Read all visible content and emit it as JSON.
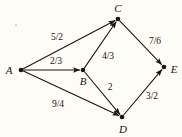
{
  "figure": {
    "background_color": "#fdfcf6",
    "ink_color": "#17140f",
    "width": 182,
    "height": 137
  },
  "diagram": {
    "type": "directed-weighted-graph",
    "nodes": [
      {
        "id": "A",
        "label": "A",
        "x": 21,
        "y": 70,
        "label_x": 9,
        "label_y": 70
      },
      {
        "id": "B",
        "label": "B",
        "x": 83,
        "y": 70,
        "label_x": 83,
        "label_y": 81
      },
      {
        "id": "C",
        "label": "C",
        "x": 118,
        "y": 19,
        "label_x": 118,
        "label_y": 8
      },
      {
        "id": "D",
        "label": "D",
        "x": 122,
        "y": 117,
        "label_x": 123,
        "label_y": 129
      },
      {
        "id": "E",
        "label": "E",
        "x": 164,
        "y": 67,
        "label_x": 174,
        "label_y": 69
      }
    ],
    "edges": [
      {
        "from": "A",
        "to": "C",
        "weight": "5/2",
        "label_x": 57,
        "label_y": 38
      },
      {
        "from": "A",
        "to": "B",
        "weight": "2/3",
        "label_x": 56,
        "label_y": 62
      },
      {
        "from": "A",
        "to": "D",
        "weight": "9/4",
        "label_x": 58,
        "label_y": 105
      },
      {
        "from": "B",
        "to": "C",
        "weight": "4/3",
        "label_x": 108,
        "label_y": 57
      },
      {
        "from": "B",
        "to": "D",
        "weight": "2",
        "label_x": 110,
        "label_y": 88
      },
      {
        "from": "C",
        "to": "E",
        "weight": "7/6",
        "label_x": 155,
        "label_y": 42
      },
      {
        "from": "D",
        "to": "E",
        "weight": "3/2",
        "label_x": 152,
        "label_y": 97
      }
    ],
    "artifacts": [
      {
        "name": "scan-speck",
        "x": 15,
        "y": 24
      }
    ]
  }
}
